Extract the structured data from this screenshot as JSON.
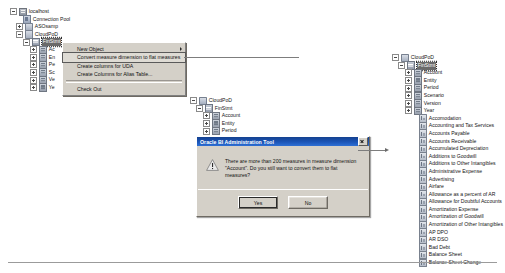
{
  "left_tree": {
    "nodes": [
      {
        "label": "localhost",
        "icon": "server-icon",
        "indent": 0,
        "expander": "minus",
        "selected": false
      },
      {
        "label": "Connection Pool",
        "icon": "pool-icon",
        "indent": 1,
        "expander": "none",
        "selected": false
      },
      {
        "label": "ASOsamp",
        "icon": "schema-icon",
        "indent": 1,
        "expander": "plus",
        "selected": false
      },
      {
        "label": "CloudPoD",
        "icon": "schema-icon",
        "indent": 1,
        "expander": "minus",
        "selected": false
      },
      {
        "label": "FinStmt",
        "icon": "cube-icon",
        "indent": 2,
        "expander": "minus",
        "selected": true
      },
      {
        "label": "Ac",
        "icon": "dimension-icon",
        "indent": 3,
        "expander": "plus",
        "selected": false
      },
      {
        "label": "En",
        "icon": "dimension-icon",
        "indent": 3,
        "expander": "plus",
        "selected": false
      },
      {
        "label": "Pe",
        "icon": "dimension-icon",
        "indent": 3,
        "expander": "plus",
        "selected": false
      },
      {
        "label": "Sc",
        "icon": "dimension-icon",
        "indent": 3,
        "expander": "plus",
        "selected": false
      },
      {
        "label": "Ve",
        "icon": "dimension-icon",
        "indent": 3,
        "expander": "plus",
        "selected": false
      },
      {
        "label": "Ye",
        "icon": "dimension-icon",
        "indent": 3,
        "expander": "plus",
        "selected": false
      }
    ]
  },
  "context_menu": {
    "items": [
      {
        "label": "New Object",
        "has_submenu": true,
        "boxed": false,
        "separator_after": false
      },
      {
        "label": "Convert measure dimension to flat measures",
        "has_submenu": false,
        "boxed": true,
        "separator_after": false
      },
      {
        "label": "Create columns for UDA",
        "has_submenu": false,
        "boxed": false,
        "separator_after": false
      },
      {
        "label": "Create Columns for Alias Table...",
        "has_submenu": false,
        "boxed": false,
        "separator_after": true
      },
      {
        "label": "Check Out",
        "has_submenu": false,
        "boxed": false,
        "separator_after": false
      }
    ]
  },
  "middle_tree": {
    "nodes": [
      {
        "label": "CloudPoD",
        "icon": "schema-icon",
        "indent": 0,
        "expander": "minus",
        "selected": false
      },
      {
        "label": "FinStmt",
        "icon": "cube-icon",
        "indent": 1,
        "expander": "minus",
        "selected": false
      },
      {
        "label": "Account",
        "icon": "dimension-icon",
        "indent": 2,
        "expander": "plus",
        "selected": false
      },
      {
        "label": "Entity",
        "icon": "dimension-icon",
        "indent": 2,
        "expander": "plus",
        "selected": false
      },
      {
        "label": "Period",
        "icon": "dimension-icon",
        "indent": 2,
        "expander": "plus",
        "selected": false
      }
    ]
  },
  "dialog": {
    "title": "Oracle BI Administration Tool",
    "icon": "warning-icon",
    "close_label": "Close",
    "message": "There are more than 200 measures in measure dimension\n\"Account\". Do you still want to convert them to flat measures?",
    "buttons": [
      {
        "label": "Yes",
        "default": true
      },
      {
        "label": "No",
        "default": false
      }
    ]
  },
  "right_tree": {
    "nodes": [
      {
        "label": "CloudPoD",
        "icon": "schema-icon",
        "indent": 0,
        "expander": "minus",
        "selected": false
      },
      {
        "label": "FinStmt",
        "icon": "cube-icon",
        "indent": 1,
        "expander": "minus",
        "selected": true
      },
      {
        "label": "Account",
        "icon": "dimension-icon",
        "indent": 2,
        "expander": "plus",
        "selected": false
      },
      {
        "label": "Entity",
        "icon": "dimension-icon",
        "indent": 2,
        "expander": "plus",
        "selected": false
      },
      {
        "label": "Period",
        "icon": "dimension-icon",
        "indent": 2,
        "expander": "plus",
        "selected": false
      },
      {
        "label": "Scenario",
        "icon": "dimension-icon",
        "indent": 2,
        "expander": "plus",
        "selected": false
      },
      {
        "label": "Version",
        "icon": "dimension-icon",
        "indent": 2,
        "expander": "plus",
        "selected": false
      },
      {
        "label": "Year",
        "icon": "dimension-icon",
        "indent": 2,
        "expander": "plus",
        "selected": false
      },
      {
        "label": "Accomodation",
        "icon": "measure-icon",
        "indent": 3,
        "expander": "none",
        "selected": false
      },
      {
        "label": "Accounting and Tax Services",
        "icon": "measure-icon",
        "indent": 3,
        "expander": "none",
        "selected": false
      },
      {
        "label": "Accounts Payable",
        "icon": "measure-icon",
        "indent": 3,
        "expander": "none",
        "selected": false
      },
      {
        "label": "Accounts Receivable",
        "icon": "measure-icon",
        "indent": 3,
        "expander": "none",
        "selected": false
      },
      {
        "label": "Accumulated Depreciation",
        "icon": "measure-icon",
        "indent": 3,
        "expander": "none",
        "selected": false
      },
      {
        "label": "Additions to Goodwill",
        "icon": "measure-icon",
        "indent": 3,
        "expander": "none",
        "selected": false
      },
      {
        "label": "Additions to Other Intangibles",
        "icon": "measure-icon",
        "indent": 3,
        "expander": "none",
        "selected": false
      },
      {
        "label": "Administrative Expense",
        "icon": "measure-icon",
        "indent": 3,
        "expander": "none",
        "selected": false
      },
      {
        "label": "Advertising",
        "icon": "measure-icon",
        "indent": 3,
        "expander": "none",
        "selected": false
      },
      {
        "label": "Airfare",
        "icon": "measure-icon",
        "indent": 3,
        "expander": "none",
        "selected": false
      },
      {
        "label": "Allowance as a percent of AR",
        "icon": "measure-icon",
        "indent": 3,
        "expander": "none",
        "selected": false
      },
      {
        "label": "Allowance for Doubtful Accounts",
        "icon": "measure-icon",
        "indent": 3,
        "expander": "none",
        "selected": false
      },
      {
        "label": "Amortization Expense",
        "icon": "measure-icon",
        "indent": 3,
        "expander": "none",
        "selected": false
      },
      {
        "label": "Amortization of Goodwill",
        "icon": "measure-icon",
        "indent": 3,
        "expander": "none",
        "selected": false
      },
      {
        "label": "Amortization of Other Intangibles",
        "icon": "measure-icon",
        "indent": 3,
        "expander": "none",
        "selected": false
      },
      {
        "label": "AP DPO",
        "icon": "measure-icon",
        "indent": 3,
        "expander": "none",
        "selected": false
      },
      {
        "label": "AR DSO",
        "icon": "measure-icon",
        "indent": 3,
        "expander": "none",
        "selected": false
      },
      {
        "label": "Bad Debt",
        "icon": "measure-icon",
        "indent": 3,
        "expander": "none",
        "selected": false
      },
      {
        "label": "Balance Sheet",
        "icon": "measure-icon",
        "indent": 3,
        "expander": "none",
        "selected": false
      },
      {
        "label": "Balance Sheet Change",
        "icon": "measure-icon",
        "indent": 3,
        "expander": "none",
        "selected": false
      }
    ]
  }
}
